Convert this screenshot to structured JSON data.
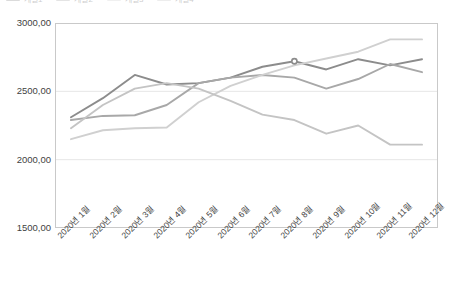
{
  "chart_data": {
    "type": "line",
    "title": "",
    "xlabel": "",
    "ylabel": "",
    "ylim": [
      1500,
      3000
    ],
    "ytick_labels": [
      "3000,00",
      "2500,00",
      "2000,00",
      "1500,00"
    ],
    "ytick_values": [
      3000,
      2500,
      2000,
      1500
    ],
    "grid": true,
    "legend_position": "top",
    "categories": [
      "2020년 1월",
      "2020년 2월",
      "2020년 3월",
      "2020년 4월",
      "2020년 5월",
      "2020년 6월",
      "2020년 7월",
      "2020년 8월",
      "2020년 9월",
      "2020년 10월",
      "2020년 11월",
      "2020년 12월"
    ],
    "series": [
      {
        "name": "계열1",
        "color": "#8c8c8c",
        "values": [
          2310,
          2450,
          2620,
          2550,
          2560,
          2600,
          2680,
          2720,
          2660,
          2735,
          2690,
          2735
        ]
      },
      {
        "name": "계열2",
        "color": "#a8a8a8",
        "values": [
          2290,
          2320,
          2325,
          2400,
          2560,
          2600,
          2620,
          2600,
          2520,
          2590,
          2700,
          2640
        ]
      },
      {
        "name": "계열3",
        "color": "#d0d0d0",
        "values": [
          2150,
          2215,
          2230,
          2235,
          2420,
          2540,
          2620,
          2690,
          2740,
          2790,
          2880,
          2880
        ]
      },
      {
        "name": "계열4",
        "color": "#c4c4c4",
        "values": [
          2230,
          2400,
          2520,
          2560,
          2520,
          2430,
          2330,
          2290,
          2190,
          2250,
          2110,
          2110
        ]
      }
    ]
  },
  "legend": {
    "entries": [
      {
        "label": "계열1"
      },
      {
        "label": "계열2"
      },
      {
        "label": "계열3"
      },
      {
        "label": "계열4"
      }
    ]
  },
  "axis": {
    "y_labels": [
      "3000,00",
      "2500,00",
      "2000,00",
      "1500,00"
    ],
    "x_labels": [
      "2020년 1월",
      "2020년 2월",
      "2020년 3월",
      "2020년 4월",
      "2020년 5월",
      "2020년 6월",
      "2020년 7월",
      "2020년 8월",
      "2020년 9월",
      "2020년 10월",
      "2020년 11월",
      "2020년 12월"
    ]
  }
}
